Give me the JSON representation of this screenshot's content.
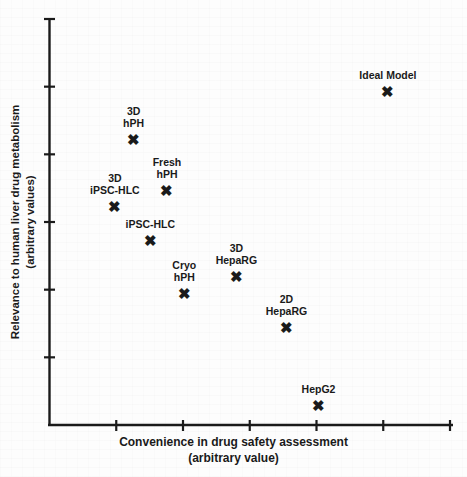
{
  "chart_data": {
    "type": "scatter",
    "title": "",
    "xlabel": "Convenience in drug safety assessment\n(arbitrary value)",
    "ylabel": "Relevance to human liver drug metabolism\n(arbitrary values)",
    "xlabel_line1": "Convenience in drug safety assessment",
    "xlabel_line2": "(arbitrary value)",
    "ylabel_line1": "Relevance to human liver drug metabolism",
    "ylabel_line2": "(arbitrary values)",
    "xlim": [
      0,
      6
    ],
    "ylim": [
      0,
      6
    ],
    "grid": false,
    "legend": "none",
    "marker": "x",
    "marker_color": "#1a1a1a",
    "axis_color": "#1a1a1a",
    "x_ticks": [
      0,
      1,
      2,
      3,
      4,
      5,
      6
    ],
    "y_ticks": [
      0,
      1,
      2,
      3,
      4,
      5,
      6
    ],
    "x_tick_labels": [
      "",
      "",
      "",
      "",
      "",
      "",
      ""
    ],
    "y_tick_labels": [
      "",
      "",
      "",
      "",
      "",
      "",
      ""
    ],
    "points": [
      {
        "label": "Ideal Model",
        "label_lines": [
          "Ideal Model"
        ],
        "x": 5.07,
        "y": 4.93
      },
      {
        "label": "3D hPH",
        "label_lines": [
          "3D",
          "hPH"
        ],
        "x": 1.26,
        "y": 4.23
      },
      {
        "label": "Fresh hPH",
        "label_lines": [
          "Fresh",
          "hPH"
        ],
        "x": 1.76,
        "y": 3.48
      },
      {
        "label": "3D iPSC-HLC",
        "label_lines": [
          "3D",
          "iPSC-HLC"
        ],
        "x": 0.98,
        "y": 3.23
      },
      {
        "label": "iPSC-HLC",
        "label_lines": [
          "iPSC-HLC"
        ],
        "x": 1.51,
        "y": 2.74
      },
      {
        "label": "3D HepaRG",
        "label_lines": [
          "3D",
          "HepaRG"
        ],
        "x": 2.8,
        "y": 2.2
      },
      {
        "label": "Cryo hPH",
        "label_lines": [
          "Cryo",
          "hPH"
        ],
        "x": 2.02,
        "y": 1.95
      },
      {
        "label": "2D HepaRG",
        "label_lines": [
          "2D",
          "HepaRG"
        ],
        "x": 3.55,
        "y": 1.45
      },
      {
        "label": "HepG2",
        "label_lines": [
          "HepG2"
        ],
        "x": 4.03,
        "y": 0.3
      }
    ]
  },
  "figure": {
    "marker_glyph": "✖"
  }
}
